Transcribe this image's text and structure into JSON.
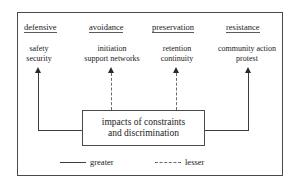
{
  "figure": {
    "columns": [
      {
        "header": "defensive",
        "items": [
          "safety",
          "security"
        ],
        "arrow_style": "solid",
        "arrow_meaning": "greater"
      },
      {
        "header": "avoidance",
        "items": [
          "initiation",
          "support networks"
        ],
        "arrow_style": "dashed",
        "arrow_meaning": "lesser"
      },
      {
        "header": "preservation",
        "items": [
          "retention",
          "continuity"
        ],
        "arrow_style": "dashed",
        "arrow_meaning": "lesser"
      },
      {
        "header": "resistance",
        "items": [
          "community action",
          "protest"
        ],
        "arrow_style": "solid",
        "arrow_meaning": "greater"
      }
    ],
    "center_box": {
      "line1": "impacts of constraints",
      "line2": "and discrimination"
    },
    "legend": {
      "greater_label": "greater",
      "lesser_label": "lesser"
    },
    "colors": {
      "frame": "#4a4a4a",
      "line": "#3d3d3d",
      "dashed_line": "#6a6a6a",
      "text": "#1a1a1a",
      "background": "#ffffff"
    }
  }
}
